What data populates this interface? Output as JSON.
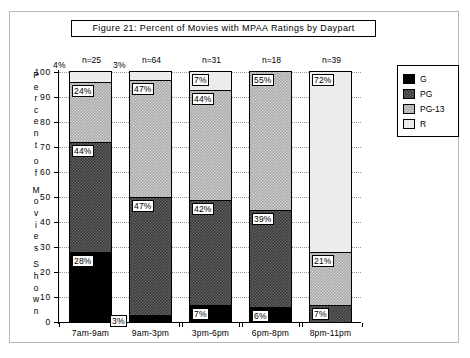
{
  "figure": {
    "title": "Figure 21:  Percent of Movies with MPAA Ratings by Daypart",
    "y_axis_caption_letters": [
      "P",
      "e",
      "r",
      "c",
      "e",
      "n",
      "t",
      "",
      "o",
      "f",
      "",
      "M",
      "o",
      "v",
      "i",
      "e",
      "s",
      "",
      "S",
      "h",
      "o",
      "w",
      "n"
    ]
  },
  "legend": {
    "items": [
      {
        "label": "G",
        "color": "#000000"
      },
      {
        "label": "PG",
        "color": "#3a3a3a"
      },
      {
        "label": "PG-13",
        "color": "#a8a8a8"
      },
      {
        "label": "R",
        "color": "#e6e6e6"
      }
    ]
  },
  "chart_data": {
    "type": "bar",
    "title": "Figure 21:  Percent of Movies with MPAA Ratings by Daypart",
    "xlabel": "",
    "ylabel": "Percent of Movies Shown",
    "ylim": [
      0,
      100
    ],
    "yticks": [
      "0",
      "10",
      "20",
      "30",
      "40",
      "50",
      "60",
      "70",
      "80",
      "90",
      "100"
    ],
    "grid": true,
    "stacked": true,
    "legend_position": "right",
    "categories": [
      "7am-9am",
      "9am-3pm",
      "3pm-6pm",
      "6pm-8pm",
      "8pm-11pm"
    ],
    "sample_sizes": [
      "n=25",
      "n=64",
      "n=31",
      "n=18",
      "n=39"
    ],
    "series": [
      {
        "name": "G",
        "values": [
          28,
          3,
          7,
          6,
          0
        ]
      },
      {
        "name": "PG",
        "values": [
          44,
          47,
          42,
          39,
          7
        ]
      },
      {
        "name": "PG-13",
        "values": [
          24,
          47,
          44,
          55,
          21
        ]
      },
      {
        "name": "R",
        "values": [
          4,
          3,
          7,
          0,
          72
        ]
      }
    ],
    "bar_labels": [
      [
        {
          "rating": "G",
          "text": "28%",
          "value": 28,
          "placement": "inside"
        },
        {
          "rating": "PG",
          "text": "44%",
          "value": 44,
          "placement": "inside"
        },
        {
          "rating": "PG-13",
          "text": "24%",
          "value": 24,
          "placement": "inside"
        },
        {
          "rating": "R",
          "text": "4%",
          "value": 4,
          "placement": "outside-top"
        }
      ],
      [
        {
          "rating": "G",
          "text": "3%",
          "value": 3,
          "placement": "outside-bottom"
        },
        {
          "rating": "PG",
          "text": "47%",
          "value": 47,
          "placement": "inside"
        },
        {
          "rating": "PG-13",
          "text": "47%",
          "value": 47,
          "placement": "inside"
        },
        {
          "rating": "R",
          "text": "3%",
          "value": 3,
          "placement": "outside-top"
        }
      ],
      [
        {
          "rating": "G",
          "text": "7%",
          "value": 7,
          "placement": "inside"
        },
        {
          "rating": "PG",
          "text": "42%",
          "value": 42,
          "placement": "inside"
        },
        {
          "rating": "PG-13",
          "text": "44%",
          "value": 44,
          "placement": "inside"
        },
        {
          "rating": "R",
          "text": "7%",
          "value": 7,
          "placement": "inside"
        }
      ],
      [
        {
          "rating": "G",
          "text": "6%",
          "value": 6,
          "placement": "inside"
        },
        {
          "rating": "PG",
          "text": "39%",
          "value": 39,
          "placement": "inside"
        },
        {
          "rating": "PG-13",
          "text": "55%",
          "value": 55,
          "placement": "inside"
        }
      ],
      [
        {
          "rating": "PG",
          "text": "7%",
          "value": 7,
          "placement": "inside"
        },
        {
          "rating": "PG-13",
          "text": "21%",
          "value": 21,
          "placement": "inside"
        },
        {
          "rating": "R",
          "text": "72%",
          "value": 72,
          "placement": "inside"
        }
      ]
    ]
  }
}
